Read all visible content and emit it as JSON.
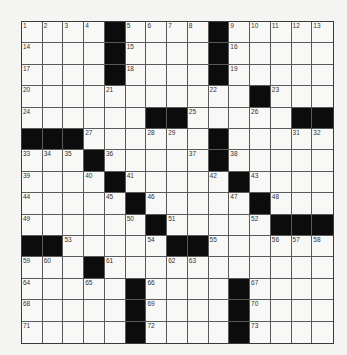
{
  "puzzle": {
    "size": {
      "rows": 15,
      "cols": 15
    },
    "grid": [
      "....#....#.....",
      "....#....#.....",
      "....#....#.....",
      "...........#...",
      "......##.....##",
      "###......#.....",
      "...#.....#.....",
      "....#.....#....",
      ".....#.....#...",
      "......#.....###",
      "##.....##......",
      "...#...........",
      ".....#....#....",
      ".....#....#....",
      ".....#....#...."
    ],
    "numbers": [
      {
        "r": 0,
        "c": 0,
        "n": 1
      },
      {
        "r": 0,
        "c": 1,
        "n": 2
      },
      {
        "r": 0,
        "c": 2,
        "n": 3
      },
      {
        "r": 0,
        "c": 3,
        "n": 4
      },
      {
        "r": 0,
        "c": 5,
        "n": 5
      },
      {
        "r": 0,
        "c": 6,
        "n": 6
      },
      {
        "r": 0,
        "c": 7,
        "n": 7
      },
      {
        "r": 0,
        "c": 8,
        "n": 8
      },
      {
        "r": 0,
        "c": 10,
        "n": 9
      },
      {
        "r": 0,
        "c": 11,
        "n": 10
      },
      {
        "r": 0,
        "c": 12,
        "n": 11
      },
      {
        "r": 0,
        "c": 13,
        "n": 12
      },
      {
        "r": 0,
        "c": 14,
        "n": 13
      },
      {
        "r": 1,
        "c": 0,
        "n": 14
      },
      {
        "r": 1,
        "c": 5,
        "n": 15
      },
      {
        "r": 1,
        "c": 10,
        "n": 16
      },
      {
        "r": 2,
        "c": 0,
        "n": 17
      },
      {
        "r": 2,
        "c": 5,
        "n": 18
      },
      {
        "r": 2,
        "c": 10,
        "n": 19
      },
      {
        "r": 3,
        "c": 0,
        "n": 20
      },
      {
        "r": 3,
        "c": 4,
        "n": 21
      },
      {
        "r": 3,
        "c": 9,
        "n": 22
      },
      {
        "r": 3,
        "c": 12,
        "n": 23
      },
      {
        "r": 4,
        "c": 0,
        "n": 24
      },
      {
        "r": 4,
        "c": 8,
        "n": 25
      },
      {
        "r": 4,
        "c": 11,
        "n": 26
      },
      {
        "r": 5,
        "c": 3,
        "n": 27
      },
      {
        "r": 5,
        "c": 6,
        "n": 28
      },
      {
        "r": 5,
        "c": 7,
        "n": 29
      },
      {
        "r": 5,
        "c": 9,
        "n": 30
      },
      {
        "r": 5,
        "c": 13,
        "n": 31
      },
      {
        "r": 5,
        "c": 14,
        "n": 32
      },
      {
        "r": 6,
        "c": 0,
        "n": 33
      },
      {
        "r": 6,
        "c": 1,
        "n": 34
      },
      {
        "r": 6,
        "c": 2,
        "n": 35
      },
      {
        "r": 6,
        "c": 4,
        "n": 36
      },
      {
        "r": 6,
        "c": 8,
        "n": 37
      },
      {
        "r": 6,
        "c": 10,
        "n": 38
      },
      {
        "r": 7,
        "c": 0,
        "n": 39
      },
      {
        "r": 7,
        "c": 3,
        "n": 40
      },
      {
        "r": 7,
        "c": 5,
        "n": 41
      },
      {
        "r": 7,
        "c": 9,
        "n": 42
      },
      {
        "r": 7,
        "c": 11,
        "n": 43
      },
      {
        "r": 8,
        "c": 0,
        "n": 44
      },
      {
        "r": 8,
        "c": 4,
        "n": 45
      },
      {
        "r": 8,
        "c": 6,
        "n": 46
      },
      {
        "r": 8,
        "c": 10,
        "n": 47
      },
      {
        "r": 8,
        "c": 12,
        "n": 48
      },
      {
        "r": 9,
        "c": 0,
        "n": 49
      },
      {
        "r": 9,
        "c": 5,
        "n": 50
      },
      {
        "r": 9,
        "c": 7,
        "n": 51
      },
      {
        "r": 9,
        "c": 11,
        "n": 52
      },
      {
        "r": 10,
        "c": 2,
        "n": 53
      },
      {
        "r": 10,
        "c": 6,
        "n": 54
      },
      {
        "r": 10,
        "c": 9,
        "n": 55
      },
      {
        "r": 10,
        "c": 12,
        "n": 56
      },
      {
        "r": 10,
        "c": 13,
        "n": 57
      },
      {
        "r": 10,
        "c": 14,
        "n": 58
      },
      {
        "r": 11,
        "c": 0,
        "n": 59
      },
      {
        "r": 11,
        "c": 1,
        "n": 60
      },
      {
        "r": 11,
        "c": 4,
        "n": 61
      },
      {
        "r": 11,
        "c": 7,
        "n": 62
      },
      {
        "r": 11,
        "c": 8,
        "n": 63
      },
      {
        "r": 12,
        "c": 0,
        "n": 64
      },
      {
        "r": 12,
        "c": 3,
        "n": 65
      },
      {
        "r": 12,
        "c": 6,
        "n": 66
      },
      {
        "r": 12,
        "c": 11,
        "n": 67
      },
      {
        "r": 13,
        "c": 0,
        "n": 68
      },
      {
        "r": 13,
        "c": 6,
        "n": 69
      },
      {
        "r": 13,
        "c": 11,
        "n": 70
      },
      {
        "r": 14,
        "c": 0,
        "n": 71
      },
      {
        "r": 14,
        "c": 6,
        "n": 72
      },
      {
        "r": 14,
        "c": 11,
        "n": 73
      }
    ],
    "colors": {
      "block": "#0c0c0c",
      "cell": "#f8f8f6",
      "line": "#5a5a5a"
    }
  }
}
